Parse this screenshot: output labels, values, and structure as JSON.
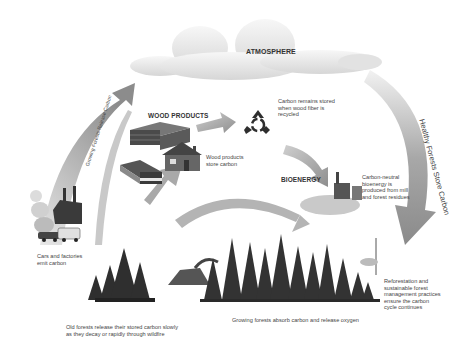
{
  "atmosphere": {
    "label": "ATMOSPHERE"
  },
  "wood_products": {
    "title": "WOOD PRODUCTS",
    "store_label": "Wood products\nstore carbon"
  },
  "recycle": {
    "label": "Carbon remains stored\nwhen wood fiber is\nrecycled"
  },
  "bioenergy": {
    "title": "BIOENERGY",
    "label": "Carbon-neutral\nbioenergy is\nproduced from mill\nand forest residues"
  },
  "arrows": {
    "left": "Growing Forests Release Carbon",
    "right": "Healthy Forests Store Carbon"
  },
  "cars_factories": {
    "label": "Cars and factories\nemit carbon"
  },
  "old_forests": {
    "label": "Old forests release their stored carbon slowly\nas they decay or rapidly through wildfire"
  },
  "growing_forests": {
    "label": "Growing forests absorb carbon and release oxygen"
  },
  "reforestation": {
    "label": "Reforestation and\nsustainable forest\nmanagement practices\nensure the carbon\ncycle continues"
  },
  "colors": {
    "arrow": "#9a9a9a",
    "cloud": "#e6e6e6",
    "trees": "#3a3a3a",
    "text": "#444444"
  }
}
